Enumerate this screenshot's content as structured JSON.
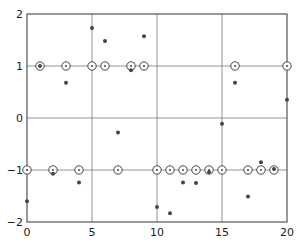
{
  "chart_data": {
    "type": "scatter",
    "title": "",
    "xlabel": "",
    "ylabel": "",
    "xlim": [
      0,
      20
    ],
    "ylim": [
      -2,
      2
    ],
    "grid": true,
    "gridlines_x": [
      5,
      10,
      15
    ],
    "gridlines_y": [
      -1,
      0,
      1
    ],
    "x_ticks": [
      "0",
      "5",
      "10",
      "15",
      "20"
    ],
    "y_ticks": [
      "2",
      "1",
      "0",
      "-1",
      "-2"
    ],
    "legend": null,
    "series": [
      {
        "name": "symbols (circles)",
        "marker": "open-circle-with-dot",
        "x": [
          0,
          1,
          2,
          3,
          4,
          5,
          6,
          7,
          8,
          9,
          10,
          11,
          12,
          13,
          14,
          15,
          16,
          17,
          18,
          19,
          20
        ],
        "y": [
          -1,
          1,
          -1,
          1,
          -1,
          1,
          1,
          -1,
          1,
          1,
          -1,
          -1,
          -1,
          -1,
          -1,
          -1,
          1,
          -1,
          -1,
          -1,
          1
        ]
      },
      {
        "name": "received (dots)",
        "marker": "filled-dot",
        "x": [
          0,
          1,
          2,
          3,
          4,
          5,
          6,
          7,
          8,
          9,
          10,
          11,
          12,
          13,
          14,
          15,
          16,
          17,
          18,
          19,
          20
        ],
        "y": [
          -1.6,
          1.0,
          -1.07,
          0.68,
          -1.24,
          1.73,
          1.48,
          -0.28,
          0.92,
          1.57,
          -1.71,
          -1.83,
          -1.24,
          -1.25,
          -1.04,
          -0.11,
          0.68,
          -1.51,
          -0.85,
          -0.98,
          0.35
        ]
      }
    ]
  },
  "colors": {
    "axis": "#555555",
    "grid": "#777777",
    "marker": "#444444"
  }
}
